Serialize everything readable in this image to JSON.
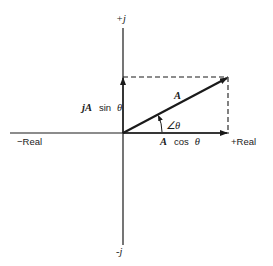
{
  "diagram": {
    "axes": {
      "positive_imaginary_label": "+j",
      "negative_imaginary_label": "-j",
      "positive_real_label": "+Real",
      "negative_real_label": "−Real"
    },
    "vector": {
      "label": "A",
      "angle_label": "∠θ"
    },
    "components": {
      "imaginary_prefix": "jA",
      "imaginary_func": "sin",
      "imaginary_var": "θ",
      "real_prefix": "A",
      "real_func": "cos",
      "real_var": "θ"
    },
    "colors": {
      "ink": "#1a1a1a",
      "background": "#ffffff"
    }
  }
}
